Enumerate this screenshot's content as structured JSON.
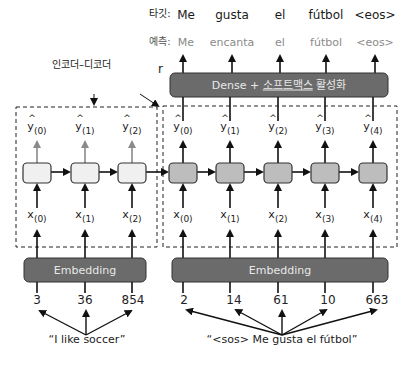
{
  "header": {
    "target_prefix": "타깃:",
    "prediction_prefix": "예측:",
    "targets": [
      "Me",
      "gusta",
      "el",
      "fútbol",
      "<eos>"
    ],
    "predictions": [
      "Me",
      "encanta",
      "el",
      "fútbol",
      "<eos>"
    ]
  },
  "dense_layer": {
    "label_prefix": "Dense + ",
    "label_underlined": "소프트맥스",
    "label_suffix": " 활성화"
  },
  "labels": {
    "encoder_decoder": "인코더–디코더",
    "r": "r"
  },
  "encoder": {
    "outputs": [
      {
        "base": "y",
        "sub": "(0)"
      },
      {
        "base": "y",
        "sub": "(1)"
      },
      {
        "base": "y",
        "sub": "(2)"
      }
    ],
    "inputs": [
      {
        "base": "x",
        "sub": "(0)"
      },
      {
        "base": "x",
        "sub": "(1)"
      },
      {
        "base": "x",
        "sub": "(2)"
      }
    ],
    "embedding_label": "Embedding",
    "token_ids": [
      "3",
      "36",
      "854"
    ],
    "sentence": "“I like soccer”"
  },
  "decoder": {
    "outputs": [
      {
        "base": "y",
        "sub": "(0)"
      },
      {
        "base": "y",
        "sub": "(1)"
      },
      {
        "base": "y",
        "sub": "(2)"
      },
      {
        "base": "y",
        "sub": "(3)"
      },
      {
        "base": "y",
        "sub": "(4)"
      }
    ],
    "inputs": [
      {
        "base": "x",
        "sub": "(0)"
      },
      {
        "base": "x",
        "sub": "(1)"
      },
      {
        "base": "x",
        "sub": "(2)"
      },
      {
        "base": "x",
        "sub": "(3)"
      },
      {
        "base": "x",
        "sub": "(4)"
      }
    ],
    "embedding_label": "Embedding",
    "token_ids": [
      "2",
      "14",
      "61",
      "10",
      "663"
    ],
    "sentence": "“<sos> Me gusta el fútbol”"
  },
  "colors": {
    "dark_box": "#6b6b6b",
    "encoder_cell": "#f0f0f0",
    "decoder_cell": "#bdbdbd",
    "encoder_output_arrow": "#8a8a8a",
    "prediction_text": "#8a8a8a"
  }
}
